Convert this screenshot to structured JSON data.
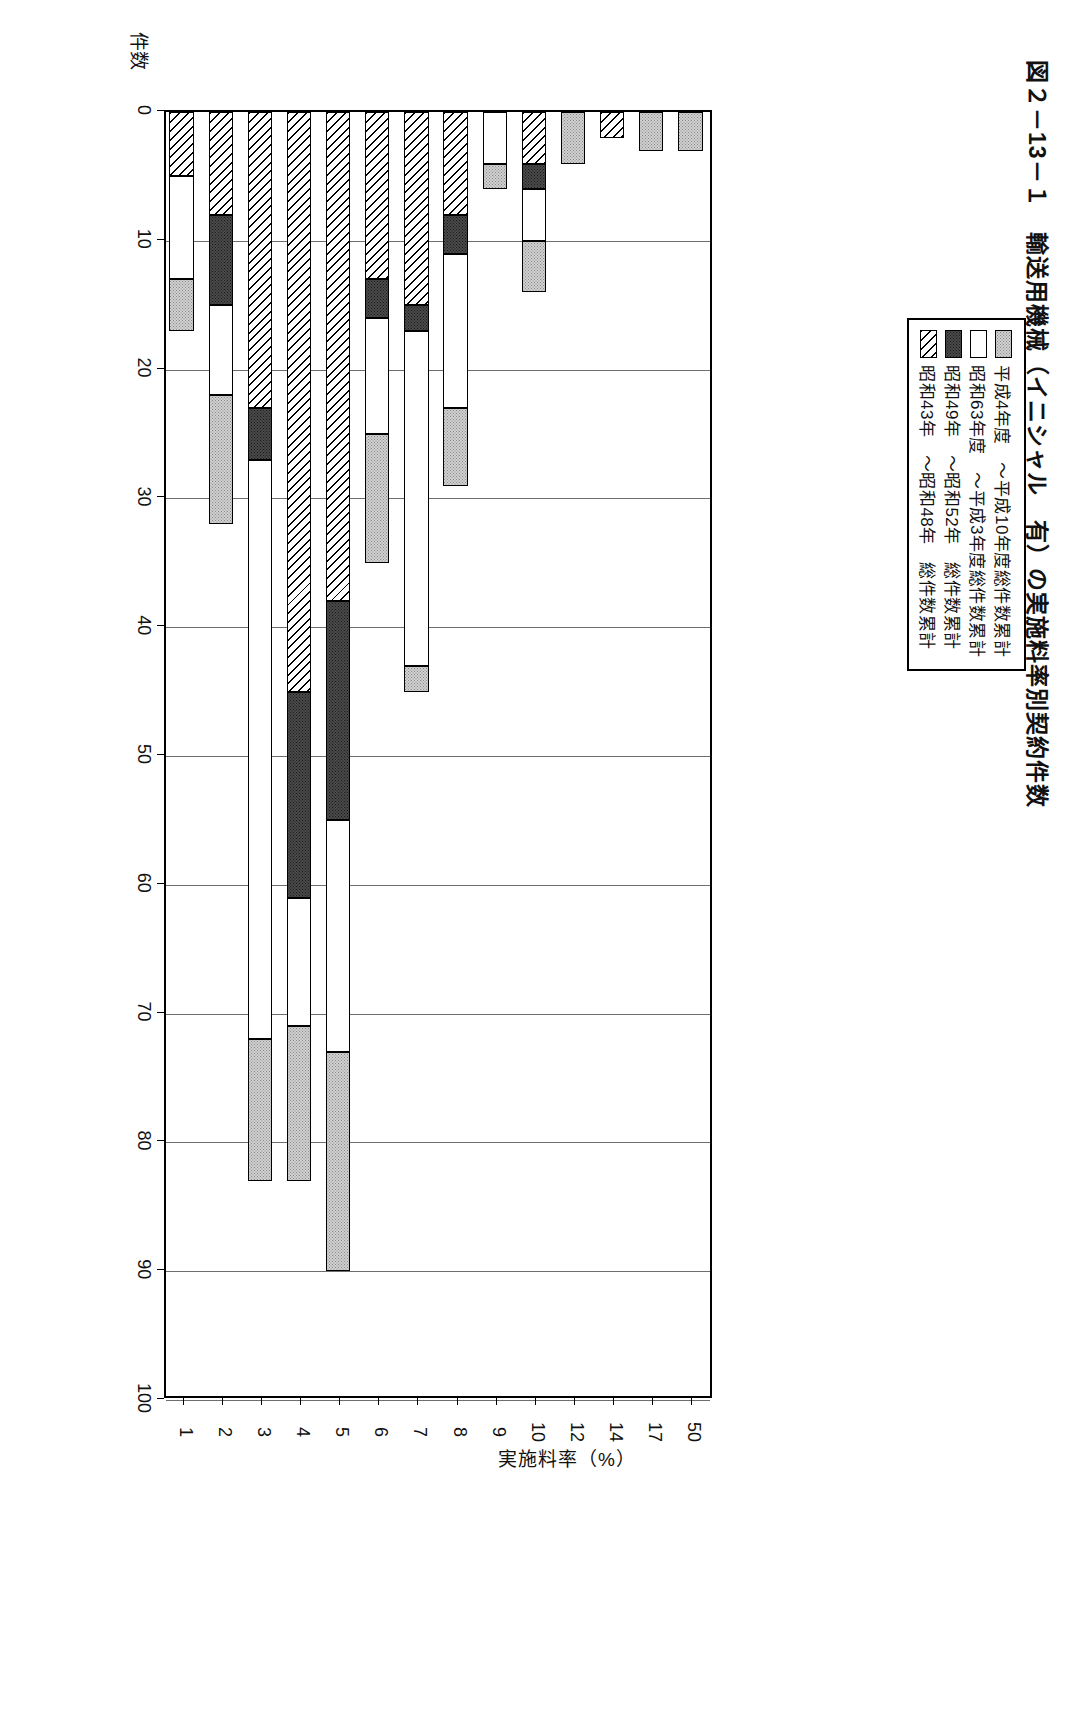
{
  "figure": {
    "title": "図２－13－１　輸送用機械（イニシャル　有）の実施料率別契約件数"
  },
  "legend": {
    "entries": [
      {
        "label": "平成4年度　～平成10年度総件数累計",
        "pattern": "light-gray-dotted",
        "color": "#d0d0d0"
      },
      {
        "label": "昭和63年度　～平成3年度総件数累計",
        "pattern": "white",
        "color": "#ffffff"
      },
      {
        "label": "昭和49年　～昭和52年　総件数累計",
        "pattern": "dark-dotted",
        "color": "#4a4a4a"
      },
      {
        "label": "昭和43年　～昭和48年　総件数累計",
        "pattern": "diagonal-hatch",
        "color": "#ffffff"
      }
    ]
  },
  "chart_data": {
    "type": "bar",
    "orientation": "vertical",
    "stacked": true,
    "title": "図２－13－１　輸送用機械（イニシャル　有）の実施料率別契約件数",
    "xlabel": "実施料率（%）",
    "ylabel": "件数",
    "ylim": [
      0,
      100
    ],
    "yticks": [
      0,
      10,
      20,
      30,
      40,
      50,
      60,
      70,
      80,
      90,
      100
    ],
    "grid": true,
    "legend_position": "top-left",
    "categories": [
      "1",
      "2",
      "3",
      "4",
      "5",
      "6",
      "7",
      "8",
      "9",
      "10",
      "12",
      "14",
      "17",
      "50"
    ],
    "series": [
      {
        "name": "昭和43年　～昭和48年　総件数累計",
        "pattern": "diagonal-hatch",
        "values": [
          5,
          8,
          23,
          45,
          38,
          13,
          15,
          8,
          0,
          4,
          0,
          2,
          0,
          0
        ]
      },
      {
        "name": "昭和49年　～昭和52年　総件数累計",
        "pattern": "dark-dotted",
        "values": [
          0,
          7,
          4,
          16,
          17,
          3,
          2,
          3,
          0,
          2,
          0,
          0,
          0,
          0
        ]
      },
      {
        "name": "昭和63年度　～平成3年度総件数累計",
        "pattern": "white",
        "values": [
          8,
          7,
          45,
          10,
          18,
          9,
          26,
          12,
          4,
          4,
          0,
          0,
          0,
          0
        ]
      },
      {
        "name": "平成4年度　～平成10年度総件数累計",
        "pattern": "light-gray-dotted",
        "values": [
          4,
          10,
          11,
          12,
          17,
          10,
          2,
          6,
          2,
          4,
          4,
          0,
          3,
          3
        ]
      }
    ],
    "totals": [
      17,
      32,
      83,
      83,
      90,
      35,
      45,
      29,
      6,
      14,
      4,
      2,
      3,
      3
    ]
  }
}
